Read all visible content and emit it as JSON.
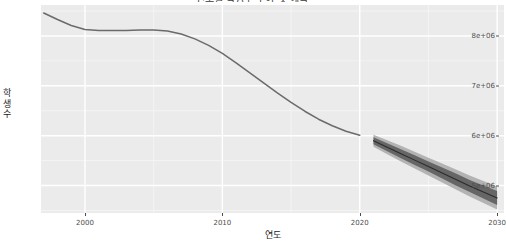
{
  "chart": {
    "title": "연도별 학생수 추이 및 예측",
    "x_axis_title": "연도",
    "y_axis_title": "학생수",
    "y_ticks": [
      {
        "label": "8e+06",
        "value": 8000000
      },
      {
        "label": "7e+06",
        "value": 7000000
      },
      {
        "label": "6e+06",
        "value": 6000000
      },
      {
        "label": "5e+06",
        "value": 5000000
      }
    ],
    "x_ticks": [
      {
        "label": "2000",
        "value": 2000
      },
      {
        "label": "2010",
        "value": 2010
      },
      {
        "label": "2020",
        "value": 2020
      },
      {
        "label": "2030",
        "value": 2030
      }
    ],
    "colors": {
      "panel_background": "#ebebeb",
      "major_gridline": "#ffffff",
      "minor_gridline": "#f5f5f5",
      "history_line": "#6b6b6b",
      "forecast_line": "#2b2b2b",
      "interval_80": "#666666",
      "interval_95": "#b3b3b3",
      "axis_text": "#4d4d4d",
      "axis_title": "#1a1a1a"
    }
  },
  "chart_data": {
    "type": "line",
    "title": "연도별 학생수 추이 및 예측",
    "xlabel": "연도",
    "ylabel": "학생수",
    "xlim": [
      1996.8,
      2030.5
    ],
    "ylim": [
      4450000,
      8620000
    ],
    "grid": true,
    "legend": "none",
    "series": [
      {
        "name": "학생수 (관측)",
        "type": "line",
        "color": "#6b6b6b",
        "x": [
          1997,
          1998,
          1999,
          2000,
          2001,
          2002,
          2003,
          2004,
          2005,
          2006,
          2007,
          2008,
          2009,
          2010,
          2011,
          2012,
          2013,
          2014,
          2015,
          2016,
          2017,
          2018,
          2019,
          2020
        ],
        "values": [
          8460000,
          8330000,
          8210000,
          8130000,
          8110000,
          8110000,
          8110000,
          8120000,
          8120000,
          8100000,
          8040000,
          7940000,
          7810000,
          7650000,
          7460000,
          7260000,
          7060000,
          6860000,
          6670000,
          6490000,
          6330000,
          6200000,
          6090000,
          6010000
        ]
      },
      {
        "name": "예측 (point forecast)",
        "type": "line",
        "color": "#2b2b2b",
        "x": [
          2021,
          2022,
          2023,
          2024,
          2025,
          2026,
          2027,
          2028,
          2029,
          2030
        ],
        "values": [
          5900000,
          5770000,
          5640000,
          5510000,
          5380000,
          5250000,
          5120000,
          4990000,
          4870000,
          4750000
        ]
      }
    ],
    "intervals": [
      {
        "name": "80% 예측구간",
        "level": 80,
        "color": "#666666",
        "x": [
          2021,
          2022,
          2023,
          2024,
          2025,
          2026,
          2027,
          2028,
          2029,
          2030
        ],
        "lower": [
          5830000,
          5690000,
          5550000,
          5410000,
          5280000,
          5140000,
          5000000,
          4870000,
          4740000,
          4610000
        ],
        "upper": [
          5970000,
          5850000,
          5730000,
          5610000,
          5480000,
          5360000,
          5240000,
          5110000,
          5000000,
          4890000
        ]
      },
      {
        "name": "95% 예측구간",
        "level": 95,
        "color": "#b3b3b3",
        "x": [
          2021,
          2022,
          2023,
          2024,
          2025,
          2026,
          2027,
          2028,
          2029,
          2030
        ],
        "lower": [
          5780000,
          5630000,
          5480000,
          5340000,
          5200000,
          5060000,
          4920000,
          4780000,
          4650000,
          4520000
        ],
        "upper": [
          6020000,
          5910000,
          5800000,
          5680000,
          5560000,
          5440000,
          5320000,
          5200000,
          5090000,
          4980000
        ]
      }
    ]
  }
}
